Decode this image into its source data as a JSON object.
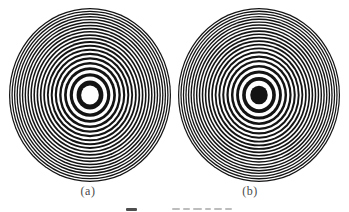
{
  "figure": {
    "type": "fresnel-zone-plates",
    "background_color": "#ffffff",
    "ink_color": "#131313",
    "subfigures": [
      {
        "label": "(a)",
        "center_zone": "open",
        "zones": 40,
        "radius_exponent": 0.6,
        "cx": 90,
        "cy": 95,
        "rx": 81,
        "ry": 87
      },
      {
        "label": "(b)",
        "center_zone": "opaque",
        "zones": 41,
        "radius_exponent": 0.6,
        "cx": 259,
        "cy": 95,
        "rx": 81,
        "ry": 87
      }
    ],
    "caption": {
      "cropped": true
    }
  }
}
